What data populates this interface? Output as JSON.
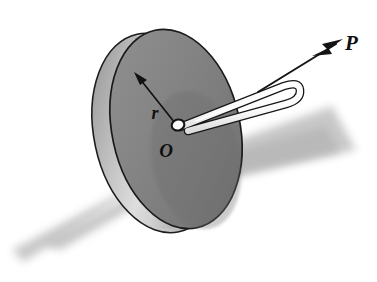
{
  "figure": {
    "background_color": "#ffffff"
  },
  "labels": {
    "force": "P",
    "center": "O",
    "radius": "r"
  },
  "colors": {
    "disc_face": "#808080",
    "disc_face_dark": "#6e6e6e",
    "disc_rim": "#ababab",
    "disc_rim_highlight": "#e6e6e6",
    "disc_outline": "#1a1a1a",
    "ground_shadow": "#bfbfbf",
    "cord_fill": "#fdfdfd",
    "cord_outline": "#1a1a1a",
    "arrow": "#1a1a1a",
    "label_color": "#101010"
  },
  "geometry": {
    "disc_center": {
      "x": 176,
      "y": 129
    },
    "disc_radius_x": 64,
    "disc_radius_y": 101,
    "disc_rotation_deg": -12,
    "hub": {
      "x": 178,
      "y": 125,
      "rx": 6,
      "ry": 5
    },
    "radius_arrow": {
      "from_x": 176,
      "from_y": 124,
      "to_x": 137,
      "to_y": 76
    },
    "force_arrow": {
      "from_x": 262,
      "from_y": 88,
      "to_x": 341,
      "to_y": 42
    },
    "label_positions": {
      "force": {
        "x": 345,
        "y": 50
      },
      "center": {
        "x": 166,
        "y": 157
      },
      "radius": {
        "x": 155,
        "y": 119
      }
    }
  },
  "elements": [
    {
      "name": "ground-shadow",
      "type": "shadow-band"
    },
    {
      "name": "disc-rim",
      "type": "cylinder-side"
    },
    {
      "name": "disc-face",
      "type": "ellipse"
    },
    {
      "name": "hub-ring",
      "type": "small-ellipse"
    },
    {
      "name": "cord-loop",
      "type": "tube-path"
    },
    {
      "name": "radius-arrow",
      "type": "arrow"
    },
    {
      "name": "force-arrow",
      "type": "arrow"
    }
  ]
}
